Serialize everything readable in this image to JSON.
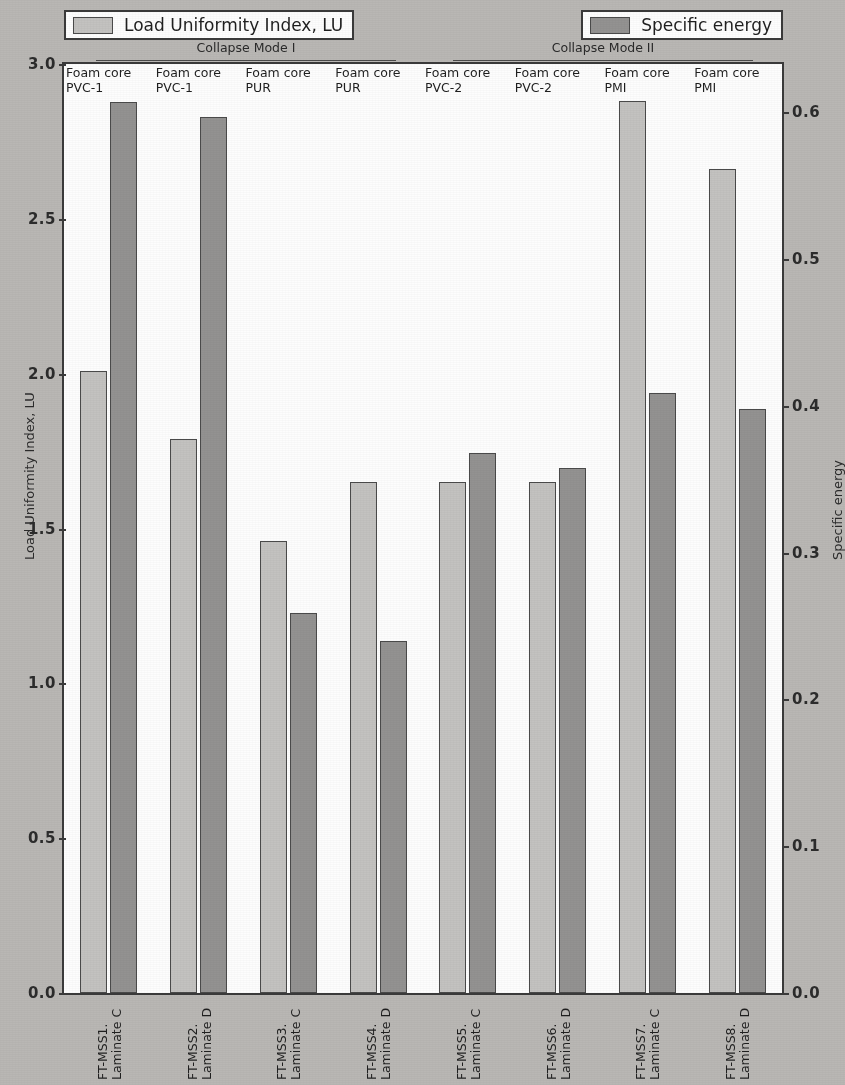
{
  "figure": {
    "background_color": "#b9b7b4",
    "plot_background_color": "#fdfdfd"
  },
  "legend": {
    "lu": {
      "label": "Load Uniformity Index, LU",
      "color": "#c3c2c0",
      "swatch_name": "legend-swatch-lu"
    },
    "se": {
      "label": "Specific energy",
      "color": "#939291",
      "swatch_name": "legend-swatch-se"
    }
  },
  "annotations": {
    "mode1": "Collapse Mode I",
    "mode2": "Collapse Mode II"
  },
  "axes": {
    "left": {
      "label": "Load Uniformity Index, LU",
      "ticks": [
        "0.0",
        "0.5",
        "1.0",
        "1.5",
        "2.0",
        "2.5",
        "3.0"
      ],
      "min": 0.0,
      "max": 3.0
    },
    "right": {
      "label": "Specific energy",
      "ticks": [
        "0.0",
        "0.1",
        "0.2",
        "0.3",
        "0.4",
        "0.5",
        "0.6"
      ],
      "min": 0.0,
      "max": 0.633
    }
  },
  "core_labels": [
    {
      "line1": "Foam core",
      "line2": "PVC-1"
    },
    {
      "line1": "Foam core",
      "line2": "PVC-1"
    },
    {
      "line1": "Foam core",
      "line2": "PUR"
    },
    {
      "line1": "Foam core",
      "line2": "PUR"
    },
    {
      "line1": "Foam core",
      "line2": "PVC-2"
    },
    {
      "line1": "Foam core",
      "line2": "PVC-2"
    },
    {
      "line1": "Foam core",
      "line2": "PMI"
    },
    {
      "line1": "Foam core",
      "line2": "PMI"
    }
  ],
  "x_labels": [
    {
      "line1": "FT-MSS1.",
      "line2": "Laminate C"
    },
    {
      "line1": "FT-MSS2.",
      "line2": "Laminate D"
    },
    {
      "line1": "FT-MSS3.",
      "line2": "Laminate C"
    },
    {
      "line1": "FT-MSS4.",
      "line2": "Laminate D"
    },
    {
      "line1": "FT-MSS5.",
      "line2": "Laminate C"
    },
    {
      "line1": "FT-MSS6.",
      "line2": "Laminate D"
    },
    {
      "line1": "FT-MSS7.",
      "line2": "Laminate C"
    },
    {
      "line1": "FT-MSS8.",
      "line2": "Laminate D"
    }
  ],
  "chart_data": {
    "type": "bar",
    "title": "",
    "xlabel": "",
    "ylabel": "Load Uniformity Index, LU",
    "y2label": "Specific energy",
    "ylim": [
      0.0,
      3.0
    ],
    "y2lim": [
      0.0,
      0.633
    ],
    "grid": false,
    "legend_position": "top",
    "categories": [
      "FT-MSS1. Laminate C",
      "FT-MSS2. Laminate D",
      "FT-MSS3. Laminate C",
      "FT-MSS4. Laminate D",
      "FT-MSS5. Laminate C",
      "FT-MSS6. Laminate D",
      "FT-MSS7. Laminate C",
      "FT-MSS8. Laminate D"
    ],
    "group_annotations": [
      {
        "name": "Collapse Mode I",
        "categories": [
          0,
          1,
          2,
          3
        ]
      },
      {
        "name": "Collapse Mode II",
        "categories": [
          4,
          5,
          6,
          7
        ]
      }
    ],
    "series": [
      {
        "name": "Load Uniformity Index, LU",
        "axis": "left",
        "color": "#c3c2c0",
        "values": [
          2.01,
          1.79,
          1.46,
          1.65,
          1.65,
          1.65,
          2.88,
          2.66
        ]
      },
      {
        "name": "Specific energy",
        "axis": "right",
        "color": "#939291",
        "values": [
          0.607,
          0.597,
          0.259,
          0.24,
          0.368,
          0.358,
          0.409,
          0.398
        ]
      }
    ]
  }
}
